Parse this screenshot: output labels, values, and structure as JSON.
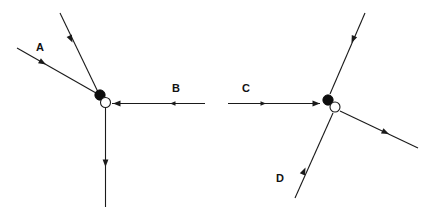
{
  "figure": {
    "background_color": "#ffffff",
    "line_color": "#1a1a1a",
    "filled_node_color": "#0d0d0d",
    "open_node_fill": "#ffffff",
    "label_color": "#111111",
    "width": 436,
    "height": 210
  },
  "diagrams": [
    {
      "id": "left",
      "name": "left-vector-diagram",
      "nodes": {
        "filled": {
          "cx": 100,
          "cy": 95,
          "r": 5.2
        },
        "open": {
          "cx": 105.5,
          "cy": 102.5,
          "r": 5.0
        }
      },
      "vectors": [
        {
          "id": "left-ray-upper",
          "label": "",
          "from": [
            60,
            13
          ],
          "to": [
            98,
            92
          ],
          "direction": "inward",
          "arrow_at": [
            72.5,
            42.5
          ],
          "arrow_angle": 64.3
        },
        {
          "id": "left-ray-a",
          "label": "A",
          "label_pos": [
            40,
            51
          ],
          "from": [
            17,
            48
          ],
          "to": [
            96,
            93
          ],
          "direction": "inward",
          "arrow_at": [
            46,
            64.5
          ],
          "arrow_angle": 29.7
        },
        {
          "id": "left-ray-b",
          "label": "B",
          "label_pos": [
            176,
            92
          ],
          "from": [
            205,
            103.5
          ],
          "to": [
            112,
            103.5
          ],
          "direction": "inward",
          "arrow_at": [
            113,
            103.5
          ],
          "arrow_angle": 180,
          "tick_at": [
            170,
            103.5
          ],
          "tick_angle": 180
        },
        {
          "id": "left-ray-vertical",
          "label": "",
          "from": [
            105.5,
            107
          ],
          "to": [
            105.5,
            207
          ],
          "direction": "outward",
          "arrow_at": [
            105.5,
            167
          ],
          "arrow_angle": 90
        }
      ]
    },
    {
      "id": "right",
      "name": "right-vector-diagram",
      "nodes": {
        "filled": {
          "cx": 328,
          "cy": 100,
          "r": 5.2
        },
        "open": {
          "cx": 335,
          "cy": 107,
          "r": 5.0
        }
      },
      "vectors": [
        {
          "id": "right-ray-c",
          "label": "C",
          "label_pos": [
            246,
            92
          ],
          "from": [
            228,
            103.5
          ],
          "to": [
            320,
            103.5
          ],
          "direction": "inward",
          "arrow_at": [
            319,
            103.5
          ],
          "arrow_angle": 0,
          "tick_at": [
            265,
            103.5
          ],
          "tick_angle": 0
        },
        {
          "id": "right-ray-upper",
          "label": "",
          "from": [
            365,
            13
          ],
          "to": [
            330,
            94
          ],
          "direction": "inward",
          "arrow_at": [
            351.5,
            43
          ],
          "arrow_angle": 66.6
        },
        {
          "id": "right-ray-lower-right",
          "label": "",
          "from": [
            340,
            111
          ],
          "to": [
            418,
            148
          ],
          "direction": "outward",
          "arrow_at": [
            389,
            134
          ],
          "arrow_angle": 25.4
        },
        {
          "id": "right-ray-d",
          "label": "D",
          "label_pos": [
            280,
            182
          ],
          "from": [
            295,
            198
          ],
          "to": [
            333,
            113
          ],
          "direction": "inward",
          "arrow_at": [
            305.5,
            167.5
          ],
          "arrow_angle": -65.9
        }
      ]
    }
  ],
  "labels": [
    {
      "text": "A",
      "x": 40,
      "y": 51
    },
    {
      "text": "B",
      "x": 176,
      "y": 92
    },
    {
      "text": "C",
      "x": 246,
      "y": 92
    },
    {
      "text": "D",
      "x": 280,
      "y": 182
    }
  ]
}
